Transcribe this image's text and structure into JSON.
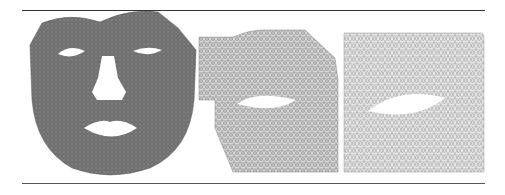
{
  "figure": {
    "panels": [
      {
        "id": "face-mesh",
        "description": "Dense triangular mesh of a face with eye, nose and mouth holes",
        "fill": "#6a6a6a"
      },
      {
        "id": "lip-region-mesh",
        "description": "Triangular mesh of cropped mouth region with one hole",
        "fill": "#b5b5b5"
      },
      {
        "id": "square-mesh",
        "description": "Triangular mesh of rectangular domain with one lens-shaped hole",
        "fill": "#c8c8c8"
      }
    ],
    "rule_color": "#333333"
  }
}
